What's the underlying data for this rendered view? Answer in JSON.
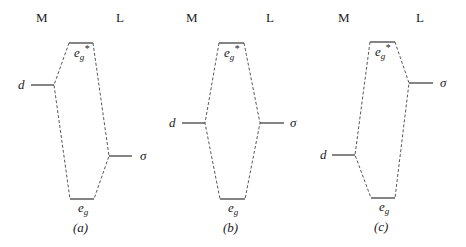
{
  "panels": [
    {
      "id": "a",
      "caption": "(a)",
      "metal_label": "M",
      "ligand_label": "L",
      "d_label": "d",
      "sigma_label": "σ",
      "antibonding_label": "e",
      "antibonding_sub": "g",
      "antibonding_sup": "*",
      "bonding_label": "e",
      "bonding_sub": "g",
      "description": "d orbital higher than ligand σ"
    },
    {
      "id": "b",
      "caption": "(b)",
      "metal_label": "M",
      "ligand_label": "L",
      "d_label": "d",
      "sigma_label": "σ",
      "antibonding_label": "e",
      "antibonding_sub": "g",
      "antibonding_sup": "*",
      "bonding_label": "e",
      "bonding_sub": "g",
      "description": "d orbital equal to ligand σ"
    },
    {
      "id": "c",
      "caption": "(c)",
      "metal_label": "M",
      "ligand_label": "L",
      "d_label": "d",
      "sigma_label": "σ",
      "antibonding_label": "e",
      "antibonding_sub": "g",
      "antibonding_sup": "*",
      "bonding_label": "e",
      "bonding_sub": "g",
      "description": "d orbital lower than ligand σ"
    }
  ]
}
